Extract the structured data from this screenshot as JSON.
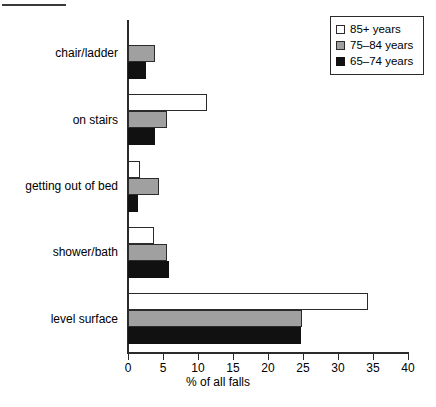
{
  "chart_data": {
    "type": "bar",
    "orientation": "horizontal",
    "title": "",
    "xlabel": "% of all falls",
    "ylabel": "",
    "xlim": [
      0,
      40
    ],
    "xticks": [
      0,
      5,
      10,
      15,
      20,
      25,
      30,
      35,
      40
    ],
    "grid": false,
    "legend_position": "top-right",
    "categories": [
      "chair/ladder",
      "on stairs",
      "getting out of bed",
      "shower/bath",
      "level surface"
    ],
    "series": [
      {
        "name": "85+ years",
        "color": "#ffffff",
        "values": [
          0,
          11.3,
          1.7,
          3.7,
          34.3
        ]
      },
      {
        "name": "75–84 years",
        "color": "#a0a0a0",
        "values": [
          3.9,
          5.6,
          4.4,
          5.6,
          24.9
        ]
      },
      {
        "name": "65–74 years",
        "color": "#111111",
        "values": [
          2.6,
          3.9,
          1.4,
          5.9,
          24.7
        ]
      }
    ]
  },
  "legend": {
    "items": [
      {
        "label": "85+ years",
        "swatch": "white-square-swatch"
      },
      {
        "label": "75–84 years",
        "swatch": "gray-square-swatch"
      },
      {
        "label": "65–74 years",
        "swatch": "black-square-swatch"
      }
    ]
  },
  "axis": {
    "x_tick_labels": [
      "0",
      "5",
      "10",
      "15",
      "20",
      "25",
      "30",
      "35",
      "40"
    ],
    "x_axis_title": "% of all falls"
  },
  "categories": [
    "chair/ladder",
    "on stairs",
    "getting out of bed",
    "shower/bath",
    "level surface"
  ]
}
